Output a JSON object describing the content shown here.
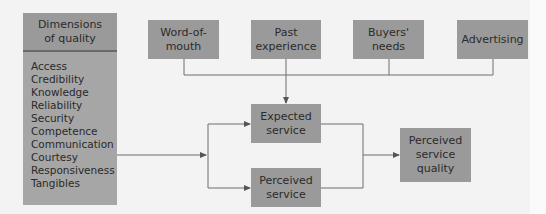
{
  "diagram": {
    "dimensions": {
      "title": "Dimensions\nof quality",
      "items": [
        "Access",
        "Credibility",
        "Knowledge",
        "Reliability",
        "Security",
        "Competence",
        "Communication",
        "Courtesy",
        "Responsiveness",
        "Tangibles"
      ]
    },
    "influences": [
      {
        "label": "Word-of-\nmouth"
      },
      {
        "label": "Past\nexperience"
      },
      {
        "label": "Buyers'\nneeds"
      },
      {
        "label": "Advertising"
      }
    ],
    "expected_service": "Expected\nservice",
    "perceived_service": "Perceived\nservice",
    "perceived_quality": "Perceived\nservice\nquality",
    "colors": {
      "box_fill": "#9a9a9a",
      "list_fill": "#a6a6a6",
      "line": "#6e6e6e",
      "background": "#f3f3f3"
    }
  }
}
